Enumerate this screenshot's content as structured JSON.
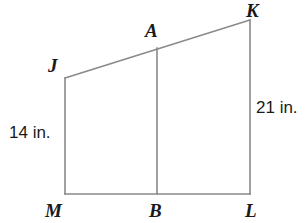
{
  "figure": {
    "type": "geometry-diagram",
    "background_color": "#ffffff",
    "stroke_color": "#8a8a8a",
    "text_color": "#1a1a1a",
    "stroke_width": 1.6,
    "vertices": [
      {
        "id": "K",
        "label": "K",
        "x": 250,
        "y": 20
      },
      {
        "id": "A",
        "label": "A",
        "x": 157,
        "y": 48
      },
      {
        "id": "J",
        "label": "J",
        "x": 65,
        "y": 78
      },
      {
        "id": "M",
        "label": "M",
        "x": 65,
        "y": 194
      },
      {
        "id": "B",
        "label": "B",
        "x": 157,
        "y": 194
      },
      {
        "id": "L",
        "label": "L",
        "x": 250,
        "y": 194
      }
    ],
    "segments": [
      {
        "id": "JK",
        "from": "J",
        "to": "K"
      },
      {
        "id": "JM",
        "from": "J",
        "to": "M"
      },
      {
        "id": "ML",
        "from": "M",
        "to": "L"
      },
      {
        "id": "KL",
        "from": "K",
        "to": "L"
      },
      {
        "id": "AB",
        "from": "A",
        "to": "B"
      }
    ],
    "measurements": [
      {
        "id": "left-measure",
        "label": "14 in.",
        "value": 14,
        "unit": "in.",
        "applies_to": "JM"
      },
      {
        "id": "right-measure",
        "label": "21 in.",
        "value": 21,
        "unit": "in.",
        "applies_to": "KL"
      }
    ]
  }
}
